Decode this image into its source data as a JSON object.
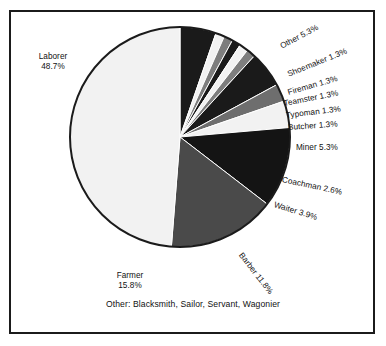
{
  "chart_data": {
    "type": "pie",
    "title": "",
    "subtitle": "",
    "xlabel": "",
    "ylabel": "",
    "legend_position": "none",
    "grid": false,
    "labels_show_percent": true,
    "total_percent": 100.0,
    "start_angle_deg": 0,
    "direction": "clockwise",
    "categories": [
      "Other",
      "Shoemaker",
      "Fireman",
      "Teamster",
      "Typoman",
      "Butcher",
      "Miner",
      "Coachman",
      "Waiter",
      "Barber",
      "Farmer",
      "Laborer"
    ],
    "values": [
      5.3,
      1.3,
      1.3,
      1.3,
      1.3,
      1.3,
      5.3,
      2.6,
      3.9,
      11.8,
      15.8,
      48.7
    ],
    "slices": [
      {
        "name": "Other",
        "percent": 5.3,
        "label": "Other 5.3%",
        "color": "#1a1a1a"
      },
      {
        "name": "Shoemaker",
        "percent": 1.3,
        "label": "Shoemaker 1.3%",
        "color": "#f2f2f2"
      },
      {
        "name": "Fireman",
        "percent": 1.3,
        "label": "Fireman 1.3%",
        "color": "#7d7d7d"
      },
      {
        "name": "Teamster",
        "percent": 1.3,
        "label": "Teamster 1.3%",
        "color": "#1a1a1a"
      },
      {
        "name": "Typoman",
        "percent": 1.3,
        "label": "Typoman 1.3%",
        "color": "#f2f2f2"
      },
      {
        "name": "Butcher",
        "percent": 1.3,
        "label": "Butcher 1.3%",
        "color": "#7d7d7d"
      },
      {
        "name": "Miner",
        "percent": 5.3,
        "label": "Miner 5.3%",
        "color": "#1a1a1a"
      },
      {
        "name": "Coachman",
        "percent": 2.6,
        "label": "Coachman 2.6%",
        "color": "#6e6e6e"
      },
      {
        "name": "Waiter",
        "percent": 3.9,
        "label": "Waiter 3.9%",
        "color": "#f2f2f2"
      },
      {
        "name": "Barber",
        "percent": 11.8,
        "label": "Barber 11.8%",
        "color": "#141414"
      },
      {
        "name": "Farmer",
        "percent": 15.8,
        "label": "Farmer 15.8%",
        "color": "#4a4a4a"
      },
      {
        "name": "Laborer",
        "percent": 48.7,
        "label": "Laborer 48.7%",
        "color": "#f2f2f2"
      }
    ]
  },
  "labels": {
    "other": "Other 5.3%",
    "shoemaker": "Shoemaker 1.3%",
    "fireman": "Fireman 1.3%",
    "teamster": "Teamster 1.3%",
    "typoman": "Typoman 1.3%",
    "butcher": "Butcher 1.3%",
    "miner": "Miner 5.3%",
    "coachman": "Coachman 2.6%",
    "waiter": "Waiter 3.9%",
    "barber": "Barber 11.8%",
    "laborer_name": "Laborer",
    "laborer_pct": "48.7%",
    "farmer_name": "Farmer",
    "farmer_pct": "15.8%"
  },
  "caption": {
    "text": "Other: Blacksmith, Sailor, Servant, Wagonier"
  },
  "colors": {
    "frame": "#1b1b1b",
    "background": "#ffffff",
    "text": "#111111",
    "slice_black": "#1a1a1a",
    "slice_gray": "#7d7d7d",
    "slice_dark_gray": "#4a4a4a",
    "slice_white": "#f2f2f2"
  }
}
